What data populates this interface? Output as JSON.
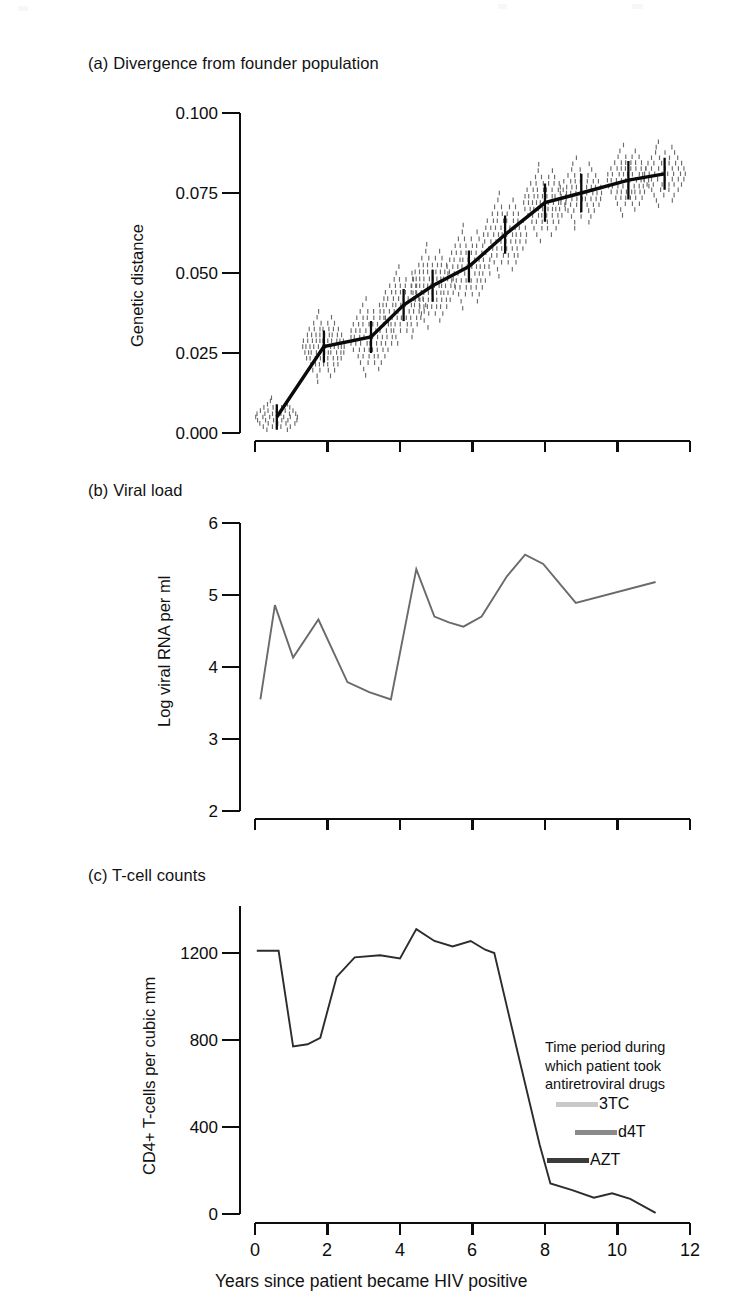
{
  "figure": {
    "panels": [
      {
        "key": "a",
        "title": "(a) Divergence from founder population",
        "ylabel": "Genetic distance",
        "yticks": [
          "0.000",
          "0.025",
          "0.050",
          "0.075",
          "0.100"
        ]
      },
      {
        "key": "b",
        "title": "(b) Viral load",
        "ylabel": "Log viral RNA per ml",
        "yticks": [
          "2",
          "3",
          "4",
          "5",
          "6"
        ]
      },
      {
        "key": "c",
        "title": "(c) T-cell counts",
        "ylabel": "CD4+ T-cells per cubic mm",
        "yticks": [
          "0",
          "400",
          "800",
          "1200"
        ]
      }
    ],
    "xlabel": "Years since patient became HIV positive",
    "xticks": [
      "0",
      "2",
      "4",
      "6",
      "8",
      "10",
      "12"
    ],
    "legend": {
      "caption_lines": [
        "Time period during",
        "which patient took",
        "antiretroviral drugs"
      ],
      "entries": [
        {
          "label": "3TC",
          "color": "#c9c9c9"
        },
        {
          "label": "d4T",
          "color": "#8a8a8a"
        },
        {
          "label": "AZT",
          "color": "#3b3b3b"
        }
      ]
    }
  },
  "chart_data": [
    {
      "type": "scatter",
      "panel": "a",
      "title": "(a) Divergence from founder population",
      "xlabel": "Years since patient became HIV positive",
      "ylabel": "Genetic distance",
      "xlim": [
        0,
        12
      ],
      "ylim": [
        0.0,
        0.1
      ],
      "yticks": [
        0.0,
        0.025,
        0.05,
        0.075,
        0.1
      ],
      "xticks": [
        0,
        2,
        4,
        6,
        8,
        10,
        12
      ],
      "grid": false,
      "notes": "Strip plot: each tiny vertical dash is one sequenced viral clone; clusters at each sampling date. Heavy black line joins cluster means with vertical error bars.",
      "mean_series": {
        "name": "Mean genetic distance",
        "x": [
          0.6,
          1.9,
          3.2,
          4.1,
          4.9,
          5.9,
          6.9,
          8.0,
          9.0,
          10.3,
          11.3
        ],
        "y": [
          0.005,
          0.027,
          0.03,
          0.04,
          0.046,
          0.052,
          0.062,
          0.072,
          0.075,
          0.079,
          0.081
        ],
        "error": [
          0.004,
          0.005,
          0.005,
          0.005,
          0.005,
          0.005,
          0.006,
          0.006,
          0.006,
          0.006,
          0.005
        ]
      },
      "clusters": [
        {
          "x": 0.6,
          "center": 0.005,
          "spread": 0.006,
          "n": 40
        },
        {
          "x": 1.9,
          "center": 0.027,
          "spread": 0.011,
          "n": 70
        },
        {
          "x": 3.2,
          "center": 0.03,
          "spread": 0.012,
          "n": 60
        },
        {
          "x": 4.1,
          "center": 0.04,
          "spread": 0.012,
          "n": 60
        },
        {
          "x": 4.9,
          "center": 0.046,
          "spread": 0.013,
          "n": 70
        },
        {
          "x": 5.9,
          "center": 0.052,
          "spread": 0.013,
          "n": 60
        },
        {
          "x": 6.9,
          "center": 0.062,
          "spread": 0.013,
          "n": 60
        },
        {
          "x": 8.0,
          "center": 0.072,
          "spread": 0.012,
          "n": 65
        },
        {
          "x": 9.0,
          "center": 0.075,
          "spread": 0.011,
          "n": 55
        },
        {
          "x": 10.3,
          "center": 0.079,
          "spread": 0.011,
          "n": 60
        },
        {
          "x": 11.3,
          "center": 0.081,
          "spread": 0.01,
          "n": 45
        }
      ]
    },
    {
      "type": "line",
      "panel": "b",
      "title": "(b) Viral load",
      "xlabel": "Years since patient became HIV positive",
      "ylabel": "Log viral RNA per ml",
      "xlim": [
        0,
        12
      ],
      "ylim": [
        2,
        6
      ],
      "yticks": [
        2,
        3,
        4,
        5,
        6
      ],
      "xticks": [
        0,
        2,
        4,
        6,
        8,
        10,
        12
      ],
      "grid": false,
      "series": [
        {
          "name": "Log viral RNA per ml",
          "x": [
            0.15,
            0.55,
            1.05,
            1.75,
            2.55,
            3.15,
            3.75,
            4.45,
            4.95,
            5.35,
            5.75,
            6.25,
            6.95,
            7.45,
            7.95,
            8.85,
            11.05
          ],
          "y": [
            3.55,
            4.86,
            4.13,
            4.66,
            3.79,
            3.65,
            3.55,
            5.36,
            4.7,
            4.62,
            4.56,
            4.7,
            5.26,
            5.56,
            5.43,
            4.89,
            5.18
          ]
        }
      ]
    },
    {
      "type": "line",
      "panel": "c",
      "title": "(c) T-cell counts",
      "xlabel": "Years since patient became HIV positive",
      "ylabel": "CD4+ T-cells per cubic mm",
      "xlim": [
        0,
        12
      ],
      "ylim": [
        0,
        1400
      ],
      "yticks": [
        0,
        400,
        800,
        1200
      ],
      "xticks": [
        0,
        2,
        4,
        6,
        8,
        10,
        12
      ],
      "grid": false,
      "series": [
        {
          "name": "CD4+ T-cells per cubic mm",
          "x": [
            0.05,
            0.65,
            1.05,
            1.45,
            1.8,
            2.25,
            2.75,
            3.45,
            4.0,
            4.45,
            4.95,
            5.45,
            5.95,
            6.35,
            6.6,
            7.25,
            7.85,
            8.15,
            8.75,
            9.35,
            9.85,
            10.35,
            11.05
          ],
          "y": [
            1210,
            1210,
            770,
            780,
            810,
            1090,
            1180,
            1190,
            1175,
            1310,
            1255,
            1230,
            1255,
            1215,
            1200,
            740,
            320,
            140,
            110,
            75,
            95,
            70,
            5
          ]
        }
      ]
    }
  ]
}
